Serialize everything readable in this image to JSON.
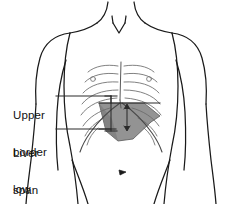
{
  "figure": {
    "background_color": "#ffffff",
    "outline_color": "#1a1a1a",
    "rib_color": "#5a5a5a",
    "liver_fill_color": "#8a8a8a",
    "liver_stroke_color": "#4a4a4a",
    "leader_line_color": "#2b2b2b"
  },
  "annotations": [
    {
      "id": "upper-border-low",
      "lines": [
        "Upper",
        "border",
        "low"
      ],
      "text": "Upper border low",
      "leader": "horizontal line from label to upper bracket tick"
    },
    {
      "id": "liver-span-normal",
      "lines": [
        "Liver",
        "span",
        "normal"
      ],
      "text": "Liver span normal",
      "leader": "horizontal line from label to lower bracket tick"
    }
  ],
  "markers": {
    "span_bracket": "vertical bracket on the right mid-clavicular line spanning upper to lower liver border",
    "span_arrow": "vertical double-headed arrow through the liver shading",
    "umbilicus": "small dark navel mark on midline of abdomen"
  }
}
